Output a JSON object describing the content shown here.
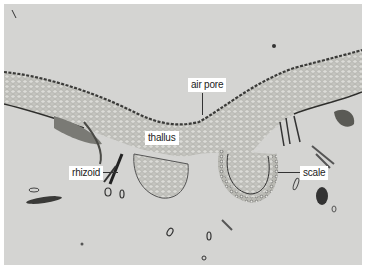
{
  "figure": {
    "labels": [
      {
        "id": "air-pore",
        "text": "air pore"
      },
      {
        "id": "thallus",
        "text": "thallus"
      },
      {
        "id": "rhizoid",
        "text": "rhizoid"
      },
      {
        "id": "scale",
        "text": "scale"
      }
    ],
    "colors": {
      "background": "#d4d4d2",
      "tissue": "#bdbdb8",
      "dark_edge": "#3a3a38",
      "label_bg": "#ffffff"
    }
  }
}
